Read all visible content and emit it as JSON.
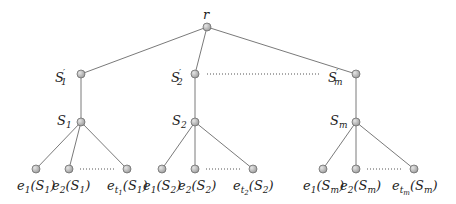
{
  "diagram": {
    "type": "tree",
    "root": {
      "label": "r",
      "x": 207,
      "y": 27
    },
    "branches": [
      {
        "prime": {
          "base": "S",
          "sub": "1",
          "prime": "′",
          "x": 81,
          "y": 74
        },
        "set": {
          "base": "S",
          "sub": "1",
          "x": 81,
          "y": 122
        },
        "leaves": [
          {
            "x": 36,
            "y": 169
          },
          {
            "x": 69,
            "y": 169
          },
          {
            "x": 127,
            "y": 169
          }
        ],
        "leaf_labels": [
          "e1(S1)",
          "e2(S1)",
          "et1(S1)"
        ]
      },
      {
        "prime": {
          "base": "S",
          "sub": "2",
          "prime": "′",
          "x": 195,
          "y": 74
        },
        "set": {
          "base": "S",
          "sub": "2",
          "x": 195,
          "y": 122
        },
        "leaves": [
          {
            "x": 162,
            "y": 169
          },
          {
            "x": 195,
            "y": 169
          },
          {
            "x": 253,
            "y": 169
          }
        ],
        "leaf_labels": [
          "e1(S2)",
          "e2(S2)",
          "et2(S2)"
        ]
      },
      {
        "prime": {
          "base": "S",
          "sub": "m",
          "prime": "′",
          "x": 356,
          "y": 74
        },
        "set": {
          "base": "S",
          "sub": "m",
          "x": 356,
          "y": 122
        },
        "leaves": [
          {
            "x": 323,
            "y": 169
          },
          {
            "x": 356,
            "y": 169
          },
          {
            "x": 414,
            "y": 169
          }
        ],
        "leaf_labels": [
          "e1(Sm)",
          "e2(Sm)",
          "etm(Sm)"
        ]
      }
    ],
    "labels": {
      "root": "r",
      "s1p_base": "S",
      "s1p_sub": "1",
      "prime": "′",
      "s1_base": "S",
      "s1_sub": "1",
      "s2p_base": "S",
      "s2p_sub": "2",
      "s2_base": "S",
      "s2_sub": "2",
      "smp_base": "S",
      "smp_sub": "m",
      "sm_base": "S",
      "sm_sub": "m",
      "e": "e",
      "open": "(",
      "close": ")",
      "one": "1",
      "two": "2",
      "m": "m",
      "t": "t"
    },
    "colors": {
      "edge": "#7a7a7a",
      "node_fill": "#bdbdbd",
      "node_stroke": "#6e6e6e",
      "text": "#222222"
    }
  }
}
